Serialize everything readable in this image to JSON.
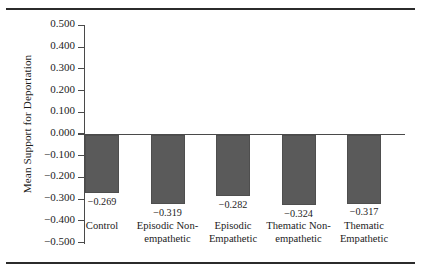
{
  "figure": {
    "top_rule": "",
    "bottom_rule": ""
  },
  "chart_data": {
    "type": "bar",
    "title": "",
    "xlabel": "",
    "ylabel": "Mean Support for Deportation",
    "ylim": [
      -0.5,
      0.5
    ],
    "ytick_step": 0.1,
    "grid": false,
    "legend": "none",
    "orientation": "vertical",
    "bar_color": "#5a5a5a",
    "axis_color": "#4a4a4a",
    "categories": [
      "Control",
      "Episodic Non-empathetic",
      "Episodic Empathetic",
      "Thematic Non-empathetic",
      "Thematic Empathetic"
    ],
    "values": [
      -0.269,
      -0.319,
      -0.282,
      -0.324,
      -0.317
    ],
    "value_labels": [
      "−0.269",
      "−0.319",
      "−0.282",
      "−0.324",
      "−0.317"
    ],
    "category_lines": [
      [
        "Control"
      ],
      [
        "Episodic Non-",
        "empathetic"
      ],
      [
        "Episodic",
        "Empathetic"
      ],
      [
        "Thematic Non-",
        "empathetic"
      ],
      [
        "Thematic",
        "Empathetic"
      ]
    ],
    "ytick_labels": [
      "0.500",
      "0.400",
      "0.300",
      "0.200",
      "0.100",
      "0.000",
      "−0.100",
      "−0.200",
      "−0.300",
      "−0.400",
      "−0.500"
    ],
    "ytick_values": [
      0.5,
      0.4,
      0.3,
      0.2,
      0.1,
      0.0,
      -0.1,
      -0.2,
      -0.3,
      -0.4,
      -0.5
    ]
  }
}
